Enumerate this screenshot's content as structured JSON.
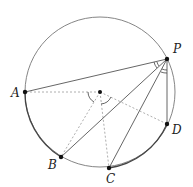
{
  "diagram": {
    "type": "geometry-circle-inscribed-angles",
    "circle": {
      "cx": 100,
      "cy": 92,
      "r": 75,
      "stroke": "#777777"
    },
    "center": {
      "x": 100,
      "y": 92
    },
    "points": {
      "P": {
        "label": "P",
        "x": 167,
        "y": 59,
        "lx": 173,
        "ly": 53
      },
      "A": {
        "label": "A",
        "x": 25,
        "y": 92,
        "lx": 11,
        "ly": 97
      },
      "B": {
        "label": "B",
        "x": 61,
        "y": 157,
        "lx": 48,
        "ly": 169
      },
      "C": {
        "label": "C",
        "x": 109,
        "y": 168,
        "lx": 106,
        "ly": 183
      },
      "D": {
        "label": "D",
        "x": 167,
        "y": 124,
        "lx": 172,
        "ly": 134
      }
    },
    "solid_chords": [
      "PA",
      "PB",
      "PC",
      "PD"
    ],
    "dashed_radii": [
      "OA",
      "OB",
      "OC",
      "OD"
    ],
    "angle_marks": [
      {
        "vertex": "P",
        "between": [
          "A",
          "B"
        ],
        "style": "double-arc"
      },
      {
        "vertex": "P",
        "between": [
          "C",
          "D"
        ],
        "style": "double-arc"
      },
      {
        "vertex": "O",
        "between": [
          "A",
          "B"
        ],
        "style": "single-arc"
      },
      {
        "vertex": "O",
        "between": [
          "C",
          "D"
        ],
        "style": "single-arc"
      }
    ],
    "colors": {
      "line": "#555555",
      "dashed": "#999999",
      "point": "#111111"
    }
  }
}
